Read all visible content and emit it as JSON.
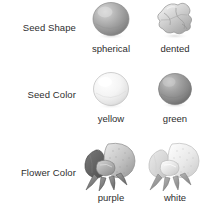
{
  "diagram": {
    "background_color": "#ffffff",
    "text_color": "#2e2e2e",
    "rows": [
      {
        "label": "Seed Shape",
        "label_name": "seed-shape",
        "variants": [
          {
            "caption": "spherical",
            "art": "spherical-seed-illustration",
            "tone": "#9a9a9a"
          },
          {
            "caption": "dented",
            "art": "dented-seed-illustration",
            "tone": "#bdbdbd"
          }
        ]
      },
      {
        "label": "Seed Color",
        "label_name": "seed-color",
        "variants": [
          {
            "caption": "yellow",
            "art": "yellow-seed-illustration",
            "tone": "#ededed"
          },
          {
            "caption": "green",
            "art": "green-seed-illustration",
            "tone": "#8f8f8f"
          }
        ]
      },
      {
        "label": "Flower Color",
        "label_name": "flower-color",
        "variants": [
          {
            "caption": "purple",
            "art": "purple-flower-illustration",
            "tone": "#8a8a8a"
          },
          {
            "caption": "white",
            "art": "white-flower-illustration",
            "tone": "#d2d2d2"
          }
        ]
      }
    ]
  }
}
